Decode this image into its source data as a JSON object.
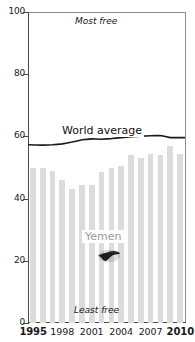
{
  "chart_data": {
    "type": "bar",
    "title": "",
    "xlabel": "",
    "ylabel": "",
    "ylim": [
      0,
      100
    ],
    "xlim": [
      1995,
      2010
    ],
    "grid": false,
    "legend": "inline-annotations",
    "categories": [
      "1995",
      "1996",
      "1997",
      "1998",
      "1999",
      "2000",
      "2001",
      "2002",
      "2003",
      "2004",
      "2005",
      "2006",
      "2007",
      "2008",
      "2009",
      "2010"
    ],
    "series": [
      {
        "name": "Yemen",
        "type": "bar",
        "color": "#dcdcdc",
        "values": [
          50,
          50,
          49,
          46,
          43,
          44.5,
          44.5,
          48.5,
          50,
          50.5,
          54,
          53,
          54.5,
          54,
          57,
          54.5
        ]
      },
      {
        "name": "World average",
        "type": "line",
        "color": "#1a1a1a",
        "values": [
          57.3,
          57.2,
          57.3,
          57.6,
          58.2,
          58.9,
          59.2,
          59.1,
          59.3,
          59.6,
          59.9,
          60.1,
          60.2,
          60.3,
          59.6,
          59.6
        ]
      }
    ],
    "y_ticks": [
      "0",
      "20",
      "40",
      "60",
      "80",
      "100"
    ],
    "y_tick_values": [
      0,
      20,
      40,
      60,
      80,
      100
    ],
    "x_ticks": [
      "1995",
      "1998",
      "2001",
      "2004",
      "2007",
      "2010"
    ],
    "x_tick_values": [
      1995,
      1998,
      2001,
      2004,
      2007,
      2010
    ],
    "x_ticks_bold": [
      "1995",
      "2010"
    ],
    "annotations": [
      {
        "name": "most-free",
        "text": "Most free",
        "x": 2002,
        "y": 96
      },
      {
        "name": "least-free",
        "text": "Least free",
        "x": 2002,
        "y": 4
      },
      {
        "name": "world-average",
        "text": "World average",
        "x": 2001,
        "y": 67
      },
      {
        "name": "yemen",
        "text": "Yemen",
        "x": 2002.5,
        "y": 30
      }
    ]
  },
  "axes": {
    "y_labels": [
      "100",
      "80",
      "60",
      "40",
      "20",
      "0"
    ],
    "x_labels": [
      {
        "text": "1995",
        "bold": true
      },
      {
        "text": "1998",
        "bold": false
      },
      {
        "text": "2001",
        "bold": false
      },
      {
        "text": "2004",
        "bold": false
      },
      {
        "text": "2007",
        "bold": false
      },
      {
        "text": "2010",
        "bold": true
      }
    ]
  },
  "labels": {
    "most_free": "Most free",
    "least_free": "Least free",
    "world_average": "World average",
    "yemen": "Yemen"
  },
  "colors": {
    "bar": "#dcdcdc",
    "line": "#1a1a1a",
    "axis": "#4a4a4a",
    "frame": "#8e8e8e",
    "text": "#1a1a1a",
    "yemen_label": "#9a9a9a",
    "background": "#ffffff"
  }
}
